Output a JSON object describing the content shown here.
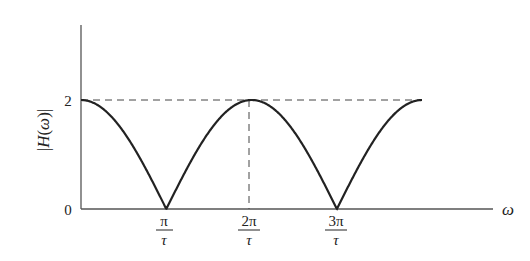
{
  "chart_data": {
    "type": "line",
    "title": "",
    "xlabel": "ω",
    "ylabel": "|H(ω)|",
    "y_ticks": [
      "0",
      "2"
    ],
    "x_ticks": [
      {
        "num": "π",
        "den": "τ",
        "value": "π/τ"
      },
      {
        "num": "2π",
        "den": "τ",
        "value": "2π/τ"
      },
      {
        "num": "3π",
        "den": "τ",
        "value": "3π/τ"
      }
    ],
    "series": [
      {
        "name": "|H(ω)| = 2|cos(ωτ/2)|",
        "x": [
          "0",
          "π/τ",
          "2π/τ",
          "3π/τ",
          "4π/τ"
        ],
        "values": [
          2,
          0,
          2,
          0,
          2
        ]
      }
    ],
    "ylim": [
      0,
      3.4
    ],
    "xlim": [
      "0",
      "≈4.9π/τ"
    ],
    "reference_lines": [
      {
        "type": "horizontal-dashed",
        "y": 2
      },
      {
        "type": "vertical-dashed",
        "x": "2π/τ"
      }
    ],
    "grid": false,
    "legend": "none"
  }
}
